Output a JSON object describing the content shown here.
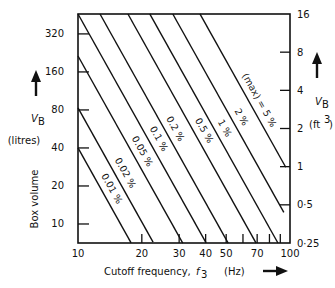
{
  "chart_data": {
    "type": "line",
    "title": "",
    "x_axis": {
      "label_prefix": "Cutoff frequency, ",
      "label_symbol": "f",
      "label_subscript": "3",
      "label_unit": "(Hz)",
      "scale": "log",
      "range": [
        10,
        100
      ],
      "tick_labels": [
        "10",
        "20",
        "30",
        "40",
        "50",
        "70",
        "100"
      ],
      "tick_values": [
        10,
        20,
        30,
        40,
        50,
        70,
        100
      ],
      "minor_ticks": [
        20,
        30,
        40,
        50,
        60,
        70,
        80,
        90
      ]
    },
    "y_axis_left": {
      "label": "Box volume",
      "symbol": "V",
      "subscript": "B",
      "unit": "(litres)",
      "scale": "log",
      "range": [
        7.07,
        460
      ],
      "tick_labels": [
        "10",
        "20",
        "40",
        "80",
        "160",
        "320"
      ],
      "tick_values": [
        10,
        20,
        40,
        80,
        160,
        320
      ]
    },
    "y_axis_right": {
      "symbol": "V",
      "subscript": "B",
      "unit_base": "(ft",
      "unit_sup": "3",
      "unit_close": ")",
      "scale": "log",
      "range": [
        0.25,
        16
      ],
      "tick_labels": [
        "0.25",
        "0.5",
        "1",
        "2",
        "4",
        "8",
        "16"
      ],
      "tick_values": [
        0.25,
        0.5,
        1,
        2,
        4,
        8,
        16
      ],
      "tick_marks": [
        0.5,
        1,
        2,
        4,
        8
      ]
    },
    "series": [
      {
        "name": "0.01 %",
        "k": 40000,
        "f_range": [
          10,
          17.8
        ],
        "label_f": 13.2
      },
      {
        "name": "0.02 %",
        "k": 83000,
        "f_range": [
          10,
          22.6
        ],
        "label_f": 15.3
      },
      {
        "name": "0.05 %",
        "k": 214000,
        "f_range": [
          10,
          31.2
        ],
        "label_f": 18.4
      },
      {
        "name": "0.1 %",
        "k": 460000,
        "f_range": [
          10,
          40.2
        ],
        "label_f": 22.0
      },
      {
        "name": "0.2 %",
        "k": 942000,
        "f_range": [
          12.7,
          51.1
        ],
        "label_f": 26.3
      },
      {
        "name": "0.5 %",
        "k": 2340000,
        "f_range": [
          17.2,
          69.2
        ],
        "label_f": 36.0
      },
      {
        "name": "1 %",
        "k": 4770000,
        "f_range": [
          21.8,
          87.7
        ],
        "label_f": 45.0
      },
      {
        "name": "2 %",
        "k": 10100000,
        "f_range": [
          28.0,
          93.5
        ],
        "label_f": 54.0
      },
      {
        "name": "(max) = 5 %",
        "k": 24500000,
        "f_range": [
          37.6,
          95.5
        ],
        "label_f": 65.5
      }
    ],
    "grid": false,
    "legend": "inline labels along curves"
  }
}
